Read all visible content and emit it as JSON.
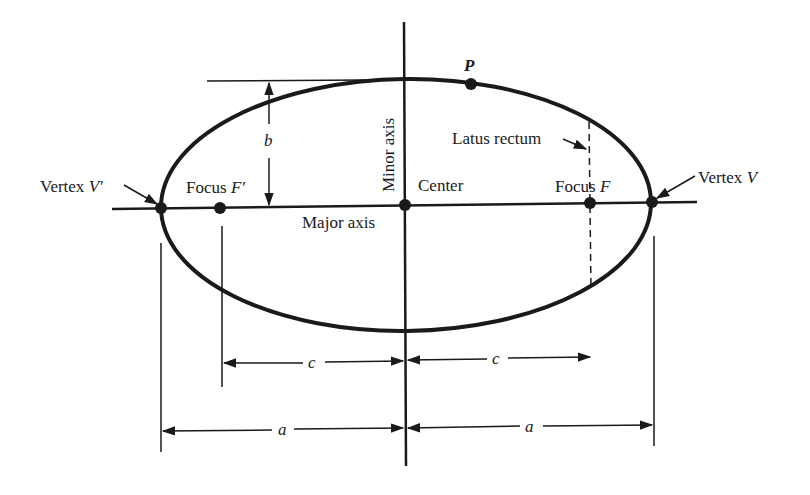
{
  "diagram": {
    "labels": {
      "vertex_left": "Vertex ",
      "vertex_left_var": "V′",
      "vertex_right": "Vertex ",
      "vertex_right_var": "V",
      "focus_left": "Focus ",
      "focus_left_var": "F′",
      "focus_right": "Focus ",
      "focus_right_var": "F",
      "center": "Center",
      "major_axis": "Major axis",
      "minor_axis": "Minor axis",
      "latus_rectum": "Latus rectum",
      "point_p": "P",
      "semi_minor": "b",
      "focal_distance_left": "c",
      "focal_distance_right": "c",
      "semi_major_left": "a",
      "semi_major_right": "a"
    },
    "colors": {
      "ink": "#1a1a1a",
      "background": "#ffffff"
    }
  }
}
